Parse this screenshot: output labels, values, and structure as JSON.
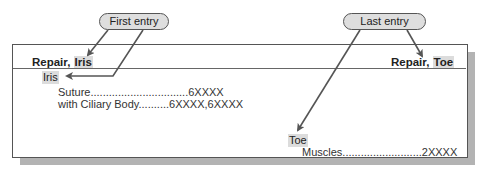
{
  "callouts": {
    "first": "First entry",
    "last": "Last entry"
  },
  "header": {
    "left": {
      "main": "Repair, ",
      "highlight": "Iris"
    },
    "right": {
      "main": "Repair, ",
      "highlight": "Toe"
    }
  },
  "entries": [
    {
      "term": "Iris",
      "subterms": [
        {
          "label": "Suture",
          "leader": "................................",
          "code": "6XXXX"
        },
        {
          "label": "with Ciliary Body",
          "leader": "..........",
          "code": "6XXXX,6XXXX"
        }
      ]
    },
    {
      "term": "Toe",
      "subterms": [
        {
          "label": "Muscles",
          "leader": "..........................",
          "code": "2XXXX"
        }
      ]
    }
  ],
  "colors": {
    "highlight": "#dcdcdc",
    "arrow": "#555555",
    "shadow": "#b3b3b3"
  }
}
